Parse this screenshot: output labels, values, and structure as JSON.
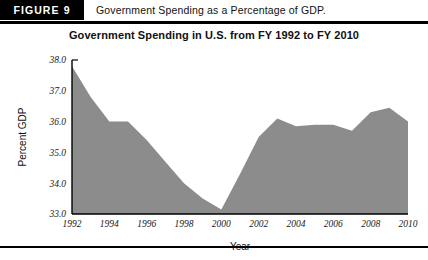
{
  "figure": {
    "tag": "FIGURE 9",
    "caption": "Government Spending as a Percentage of GDP."
  },
  "chart_data": {
    "type": "area",
    "title": "Government Spending in U.S. from FY 1992 to FY 2010",
    "xlabel": "Year",
    "ylabel": "Percent GDP",
    "xlim": [
      1992,
      2010
    ],
    "ylim": [
      33.0,
      38.0
    ],
    "grid": false,
    "legend": "none",
    "fill_color": "#8c8c8c",
    "xticks": [
      1992,
      1994,
      1996,
      1998,
      2000,
      2002,
      2004,
      2006,
      2008,
      2010
    ],
    "xtick_labels": [
      "1992",
      "1994",
      "1996",
      "1998",
      "2000",
      "2002",
      "2004",
      "2006",
      "2008",
      "2010"
    ],
    "yticks": [
      33.0,
      34.0,
      35.0,
      36.0,
      37.0,
      38.0
    ],
    "ytick_labels": [
      "33.0",
      "34.0",
      "35.0",
      "36.0",
      "37.0",
      "38.0"
    ],
    "x": [
      1992,
      1993,
      1994,
      1995,
      1996,
      1997,
      1998,
      1999,
      2000,
      2001,
      2002,
      2003,
      2004,
      2005,
      2006,
      2007,
      2008,
      2009,
      2010
    ],
    "values": [
      37.8,
      36.8,
      36.0,
      36.0,
      35.4,
      34.7,
      34.0,
      33.5,
      33.15,
      34.3,
      35.5,
      36.1,
      35.85,
      35.9,
      35.9,
      35.7,
      36.3,
      36.45,
      36.0
    ]
  }
}
